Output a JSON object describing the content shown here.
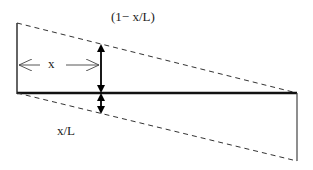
{
  "labels": {
    "upper": "(1− x/L)",
    "distance": "x",
    "lower": "x/L"
  },
  "colors": {
    "line": "#111111",
    "dashed": "#333333",
    "arrow": "#000000",
    "background": "#ffffff"
  }
}
